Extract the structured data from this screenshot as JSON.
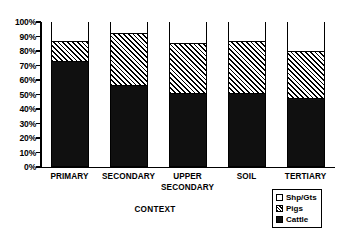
{
  "chart_data": {
    "type": "bar",
    "subtype": "stacked-percentage",
    "title": "",
    "xlabel": "CONTEXT",
    "ylabel": "",
    "categories": [
      "PRIMARY",
      "SECONDARY",
      "UPPER SECONDARY",
      "SOIL",
      "TERTIARY"
    ],
    "category_lines": [
      [
        "PRIMARY"
      ],
      [
        "SECONDARY"
      ],
      [
        "UPPER",
        "SECONDARY"
      ],
      [
        "SOIL"
      ],
      [
        "TERTIARY"
      ]
    ],
    "series": [
      {
        "name": "Cattle",
        "values": [
          72,
          55,
          50,
          50,
          46
        ]
      },
      {
        "name": "Pigs",
        "values": [
          14,
          37,
          35,
          36,
          33
        ]
      },
      {
        "name": "Shp/Gts",
        "values": [
          14,
          8,
          15,
          14,
          21
        ]
      }
    ],
    "ylim": [
      0,
      100
    ],
    "yticks": [
      "0%",
      "10%",
      "20%",
      "30%",
      "40%",
      "50%",
      "60%",
      "70%",
      "80%",
      "90%",
      "100%"
    ],
    "ytick_values": [
      0,
      10,
      20,
      30,
      40,
      50,
      60,
      70,
      80,
      90,
      100
    ],
    "grid": false,
    "legend_position": "bottom-right",
    "legend": [
      {
        "label": "Shp/Gts",
        "swatch": "white"
      },
      {
        "label": "Pigs",
        "swatch": "hatched"
      },
      {
        "label": "Cattle",
        "swatch": "black"
      }
    ],
    "colors": {
      "cattle": "#101010",
      "pigs": "#ffffff",
      "shp_gts": "#ffffff",
      "outline": "#000000"
    }
  }
}
